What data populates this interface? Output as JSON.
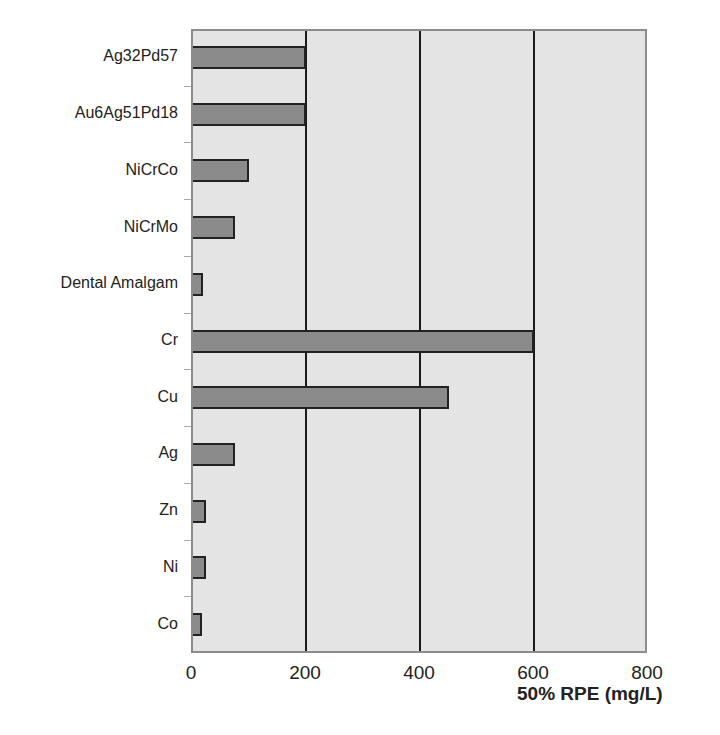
{
  "chart_data": {
    "type": "bar",
    "orientation": "horizontal",
    "title": "",
    "xlabel": "50% RPE (mg/L)",
    "ylabel": "",
    "categories": [
      "Ag32Pd57",
      "Au6Ag51Pd18",
      "NiCrCo",
      "NiCrMo",
      "Dental Amalgam",
      "Cr",
      "Cu",
      "Ag",
      "Zn",
      "Ni",
      "Co"
    ],
    "values": [
      200,
      200,
      100,
      75,
      20,
      600,
      450,
      75,
      25,
      25,
      18
    ],
    "xlim": [
      0,
      800
    ],
    "xticks": [
      "0",
      "200",
      "400",
      "600",
      "800"
    ],
    "grid": "vertical lines at 200, 400, 600",
    "legend": "none",
    "colors": {
      "plot_bg": "#e4e4e4",
      "bar_fill": "#8b8b8b",
      "bar_edge": "#222222",
      "grid": "#1a1a1a"
    }
  }
}
